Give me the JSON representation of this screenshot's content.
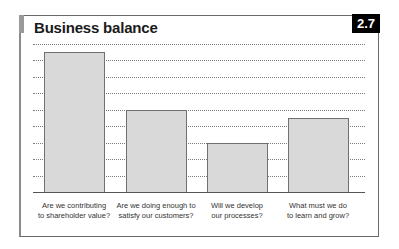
{
  "badge": "2.7",
  "chart_data": {
    "type": "bar",
    "title": "Business balance",
    "categories": [
      "Are we contributing to shareholder value?",
      "Are we doing enough to satisfy our customers?",
      "Will we develop our processes?",
      "What must we do to learn and grow?"
    ],
    "category_lines": [
      [
        "Are we contributing",
        "to shareholder value?"
      ],
      [
        "Are we doing enough to",
        "satisfy our customers?"
      ],
      [
        "Will we develop",
        "our processes?"
      ],
      [
        "What must we do",
        "to learn and grow?"
      ]
    ],
    "values": [
      8.5,
      5.0,
      3.0,
      4.5
    ],
    "xlabel": "",
    "ylabel": "",
    "ylim": [
      0,
      9
    ],
    "gridlines": 9,
    "grid": true,
    "axis_tick_labels": false,
    "legend": null,
    "bar_color": "#d9d9d9",
    "bar_border_color": "#707070"
  }
}
